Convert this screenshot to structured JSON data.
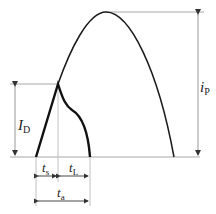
{
  "diagram": {
    "type": "waveform-timing",
    "colors": {
      "curve": "#1a1a1a",
      "guide": "#a8a8a8",
      "arrow": "#333333"
    },
    "labels": {
      "diode_current": {
        "main": "I",
        "sub": "D"
      },
      "peak_current": {
        "main": "i",
        "sub": "P"
      },
      "storage_time": {
        "main": "t",
        "sub": "s"
      },
      "fall_time": {
        "main": "t",
        "sub": "L"
      },
      "total_time": {
        "main": "t",
        "sub": "a"
      }
    }
  }
}
